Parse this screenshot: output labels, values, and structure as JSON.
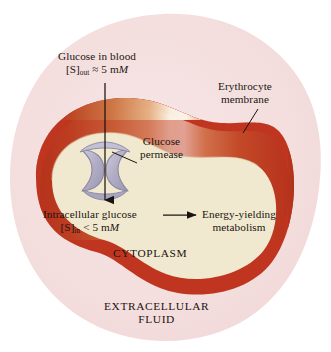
{
  "figure": {
    "name": "erythrocyte-glucose-transport-diagram",
    "colors": {
      "page_background": "#ffffff",
      "extracellular_fluid": "#f6e2e2",
      "membrane_red": "#bf3520",
      "membrane_dark": "#a8301c",
      "membrane_highlight": "#fdf6e9",
      "membrane_mid_tan": "#cf8258",
      "cytoplasm": "#f1e9cf",
      "permease_fill": "#b6b2c8",
      "permease_edge": "#8a86a0",
      "text": "#1a1410",
      "leader_line": "#1a1410"
    }
  },
  "labels": {
    "glucose_in_blood": {
      "line1": "Glucose in blood",
      "bracket_open": "[S]",
      "subscript": "out",
      "relation": "≈ 5 m",
      "unit_italic": "M"
    },
    "glucose_permease": {
      "line1": "Glucose",
      "line2": "permease"
    },
    "erythrocyte_membrane": {
      "line1": "Erythrocyte",
      "line2": "membrane"
    },
    "intracellular_glucose": {
      "line1": "Intracellular glucose",
      "bracket_open": "[S]",
      "subscript": "in",
      "relation": "< 5 m",
      "unit_italic": "M"
    },
    "energy_yielding_metabolism": {
      "line1": "Energy-yielding",
      "line2": "metabolism"
    },
    "cytoplasm": "CYTOPLASM",
    "extracellular_fluid": {
      "line1": "EXTRACELLULAR",
      "line2": "FLUID"
    }
  },
  "arrows": {
    "transport_arrow": "downward arrow through glucose permease into cytoplasm",
    "metabolism_arrow": "rightward arrow from intracellular glucose to energy-yielding metabolism"
  },
  "leader_lines": {
    "permease_leader": "from Glucose permease label down-left to permease protein",
    "membrane_leader": "from Erythrocyte membrane label down-left to cell membrane edge"
  }
}
